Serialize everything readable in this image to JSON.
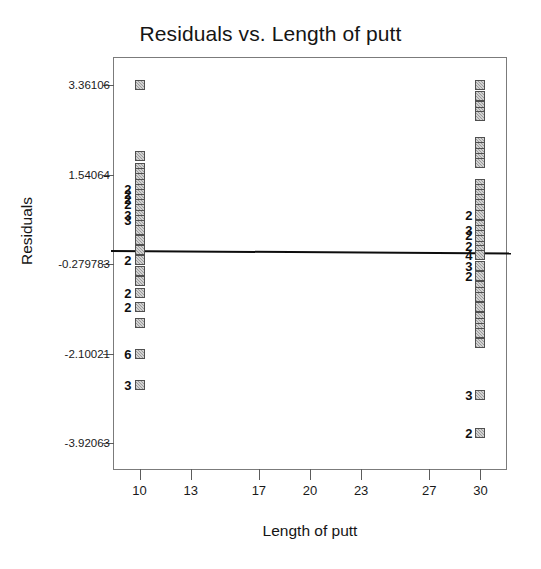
{
  "chart_data": {
    "type": "scatter",
    "title": "Residuals vs. Length of putt",
    "xlabel": "Length of putt",
    "ylabel": "Residuals",
    "grid": false,
    "legend": null,
    "xlim": [
      8.5,
      31.5
    ],
    "ylim": [
      -4.45,
      3.92
    ],
    "xticks": [
      10,
      13,
      17,
      20,
      23,
      27,
      30
    ],
    "xtick_labels": [
      "10",
      "13",
      "17",
      "20",
      "23",
      "27",
      "30"
    ],
    "yticks": [
      3.36106,
      1.54064,
      -0.279783,
      -2.10021,
      -3.92063
    ],
    "ytick_labels": [
      "3.36106",
      "1.54064",
      "-0.279783",
      "-2.10021",
      "-3.92063"
    ],
    "reference_line": {
      "y": 0.0,
      "style": "solid",
      "color": "#0d0d0d",
      "width": 2
    },
    "marker_style": {
      "shape": "square",
      "fill": "#9a9a9a",
      "edge": "#4f4f4f",
      "size": 10
    },
    "series": [
      {
        "name": "Length of putt = 10",
        "x": 10,
        "points": [
          {
            "y": 3.36106,
            "count": 1,
            "label": ""
          },
          {
            "y": 1.93,
            "count": 1,
            "label": ""
          },
          {
            "y": 1.68,
            "count": 1,
            "label": ""
          },
          {
            "y": 1.58,
            "count": 1,
            "label": ""
          },
          {
            "y": 1.47,
            "count": 1,
            "label": ""
          },
          {
            "y": 1.36,
            "count": 1,
            "label": ""
          },
          {
            "y": 1.26,
            "count": 2,
            "label": "2"
          },
          {
            "y": 1.15,
            "count": 2,
            "label": "2"
          },
          {
            "y": 1.05,
            "count": 2,
            "label": "2"
          },
          {
            "y": 0.94,
            "count": 2,
            "label": "2"
          },
          {
            "y": 0.84,
            "count": 1,
            "label": ""
          },
          {
            "y": 0.73,
            "count": 3,
            "label": "3"
          },
          {
            "y": 0.63,
            "count": 3,
            "label": "3"
          },
          {
            "y": 0.52,
            "count": 1,
            "label": ""
          },
          {
            "y": 0.42,
            "count": 1,
            "label": ""
          },
          {
            "y": 0.21,
            "count": 1,
            "label": ""
          },
          {
            "y": 0.0,
            "count": 1,
            "label": ""
          },
          {
            "y": -0.2,
            "count": 2,
            "label": "2"
          },
          {
            "y": -0.42,
            "count": 1,
            "label": ""
          },
          {
            "y": -0.63,
            "count": 1,
            "label": ""
          },
          {
            "y": -0.86,
            "count": 2,
            "label": "2"
          },
          {
            "y": -1.16,
            "count": 2,
            "label": "2"
          },
          {
            "y": -1.47,
            "count": 1,
            "label": ""
          },
          {
            "y": -2.1,
            "count": 6,
            "label": "6"
          },
          {
            "y": -2.73,
            "count": 3,
            "label": "3"
          }
        ]
      },
      {
        "name": "Length of putt = 30",
        "x": 30,
        "points": [
          {
            "y": 3.36106,
            "count": 1,
            "label": ""
          },
          {
            "y": 3.15,
            "count": 1,
            "label": ""
          },
          {
            "y": 2.94,
            "count": 1,
            "label": ""
          },
          {
            "y": 2.83,
            "count": 1,
            "label": ""
          },
          {
            "y": 2.73,
            "count": 1,
            "label": ""
          },
          {
            "y": 2.2,
            "count": 1,
            "label": ""
          },
          {
            "y": 2.1,
            "count": 1,
            "label": ""
          },
          {
            "y": 1.99,
            "count": 1,
            "label": ""
          },
          {
            "y": 1.89,
            "count": 1,
            "label": ""
          },
          {
            "y": 1.78,
            "count": 1,
            "label": ""
          },
          {
            "y": 1.36,
            "count": 1,
            "label": ""
          },
          {
            "y": 1.26,
            "count": 1,
            "label": ""
          },
          {
            "y": 1.15,
            "count": 1,
            "label": ""
          },
          {
            "y": 1.05,
            "count": 1,
            "label": ""
          },
          {
            "y": 0.94,
            "count": 1,
            "label": ""
          },
          {
            "y": 0.84,
            "count": 1,
            "label": ""
          },
          {
            "y": 0.73,
            "count": 2,
            "label": "2"
          },
          {
            "y": 0.52,
            "count": 1,
            "label": ""
          },
          {
            "y": 0.42,
            "count": 3,
            "label": "3"
          },
          {
            "y": 0.31,
            "count": 2,
            "label": "2"
          },
          {
            "y": 0.21,
            "count": 1,
            "label": ""
          },
          {
            "y": 0.1,
            "count": 2,
            "label": "2"
          },
          {
            "y": 0.0,
            "count": 1,
            "label": ""
          },
          {
            "y": -0.1,
            "count": 4,
            "label": "4"
          },
          {
            "y": -0.31,
            "count": 3,
            "label": "3"
          },
          {
            "y": -0.52,
            "count": 2,
            "label": "2"
          },
          {
            "y": -0.73,
            "count": 1,
            "label": ""
          },
          {
            "y": -0.84,
            "count": 1,
            "label": ""
          },
          {
            "y": -0.94,
            "count": 1,
            "label": ""
          },
          {
            "y": -1.15,
            "count": 1,
            "label": ""
          },
          {
            "y": -1.36,
            "count": 1,
            "label": ""
          },
          {
            "y": -1.47,
            "count": 1,
            "label": ""
          },
          {
            "y": -1.57,
            "count": 1,
            "label": ""
          },
          {
            "y": -1.68,
            "count": 1,
            "label": ""
          },
          {
            "y": -1.89,
            "count": 1,
            "label": ""
          },
          {
            "y": -2.94,
            "count": 3,
            "label": "3"
          },
          {
            "y": -3.71,
            "count": 2,
            "label": "2"
          }
        ]
      }
    ]
  }
}
